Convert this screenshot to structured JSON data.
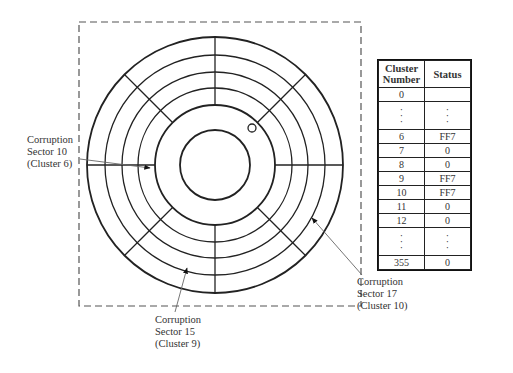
{
  "disk": {
    "center": [
      215,
      165
    ],
    "outer_radius": 128,
    "track_radii": [
      110,
      93,
      77
    ],
    "inner_data_radius": 60,
    "hub_radius": 35,
    "spoke_angles_deg": [
      0,
      45,
      90,
      135,
      180,
      225,
      270,
      315
    ],
    "index_hole": {
      "cx": 252,
      "cy": 128,
      "r": 4
    },
    "line_color": "#222222"
  },
  "frame": {
    "x": 79,
    "y": 22,
    "width": 282,
    "height": 284,
    "style": "dashed"
  },
  "callouts": [
    {
      "id": "sector10",
      "lines": [
        "Corruption",
        "Sector 10",
        "(Cluster 6)"
      ],
      "label_x": 27,
      "label_y": 135,
      "arrow_from": [
        80,
        159
      ],
      "arrow_to": [
        150,
        168
      ]
    },
    {
      "id": "sector15",
      "lines": [
        "Corruption",
        "Sector 15",
        "(Cluster 9)"
      ],
      "label_x": 155,
      "label_y": 315,
      "arrow_from": [
        175,
        312
      ],
      "arrow_to": [
        187,
        268
      ]
    },
    {
      "id": "sector17",
      "lines": [
        "Corruption",
        "Sector 17",
        "(Cluster 10)"
      ],
      "label_x": 356,
      "label_y": 277,
      "arrow_from": [
        362,
        275
      ],
      "arrow_to": [
        312,
        218
      ]
    }
  ],
  "table": {
    "headers": [
      "Cluster Number",
      "Status"
    ],
    "rows": [
      {
        "cluster": "0",
        "status": ""
      },
      {
        "cluster": "⋮",
        "status": "⋮",
        "ellipsis": true
      },
      {
        "cluster": "6",
        "status": "FF7"
      },
      {
        "cluster": "7",
        "status": "0"
      },
      {
        "cluster": "8",
        "status": "0"
      },
      {
        "cluster": "9",
        "status": "FF7"
      },
      {
        "cluster": "10",
        "status": "FF7"
      },
      {
        "cluster": "11",
        "status": "0"
      },
      {
        "cluster": "12",
        "status": "0"
      },
      {
        "cluster": "⋮",
        "status": "⋮",
        "ellipsis": true
      },
      {
        "cluster": "355",
        "status": "0"
      }
    ]
  }
}
